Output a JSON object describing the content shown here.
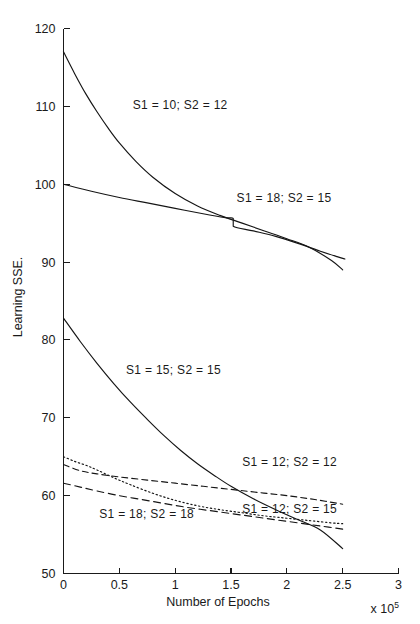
{
  "chart_data": {
    "type": "line",
    "title": "",
    "xlabel": "Number of Epochs",
    "ylabel": "Learning SSE.",
    "x_multiplier": "x 10",
    "x_multiplier_exponent": "5",
    "xlim": [
      0,
      3
    ],
    "ylim": [
      50,
      120
    ],
    "xticks": [
      "0",
      "0.5",
      "1",
      "1.5",
      "2",
      "2.5",
      "3"
    ],
    "xtick_values": [
      0,
      0.5,
      1,
      1.5,
      2,
      2.5,
      3
    ],
    "yticks": [
      "50",
      "60",
      "70",
      "80",
      "90",
      "100",
      "110",
      "120"
    ],
    "ytick_values": [
      50,
      60,
      70,
      80,
      90,
      100,
      110,
      120
    ],
    "grid": false,
    "legend_position": "inline-annotations",
    "series": [
      {
        "name": "S1 = 10;  S2 = 12",
        "style": "solid",
        "label_x": 0.62,
        "label_y": 110.2,
        "x": [
          0.0,
          0.1,
          0.2,
          0.3,
          0.4,
          0.5,
          0.65,
          0.8,
          1.0,
          1.2,
          1.4,
          1.6,
          1.8,
          2.0,
          2.2,
          2.4,
          2.5
        ],
        "y": [
          117.0,
          114.2,
          111.6,
          109.3,
          107.2,
          105.3,
          102.9,
          100.9,
          98.8,
          97.2,
          96.0,
          95.0,
          94.0,
          93.0,
          91.9,
          90.2,
          89.0
        ]
      },
      {
        "name": "S1 = 18;  S2 = 15",
        "style": "solid",
        "label_x": 1.55,
        "label_y": 98.2,
        "x": [
          0.0,
          0.25,
          0.5,
          0.75,
          1.0,
          1.25,
          1.45,
          1.52,
          1.52,
          1.7,
          1.9,
          2.1,
          2.3,
          2.45,
          2.52
        ],
        "y": [
          100.0,
          99.1,
          98.3,
          97.6,
          96.9,
          96.2,
          95.7,
          95.6,
          94.6,
          94.0,
          93.3,
          92.4,
          91.4,
          90.7,
          90.4
        ]
      },
      {
        "name": "S1 = 15;  S2 = 15",
        "style": "solid",
        "label_x": 0.56,
        "label_y": 76.2,
        "x": [
          0.0,
          0.15,
          0.3,
          0.45,
          0.6,
          0.75,
          0.9,
          1.05,
          1.2,
          1.35,
          1.5,
          1.7,
          1.9,
          2.1,
          2.3,
          2.5
        ],
        "y": [
          82.8,
          79.8,
          77.0,
          74.4,
          72.0,
          69.8,
          67.7,
          65.8,
          64.1,
          62.6,
          61.2,
          59.6,
          58.2,
          56.9,
          55.6,
          53.2
        ]
      },
      {
        "name": "S1 = 12;  S2 = 12",
        "style": "dashed",
        "label_x": 1.6,
        "label_y": 64.3,
        "x": [
          0.0,
          0.15,
          0.3,
          0.5,
          0.75,
          1.0,
          1.25,
          1.5,
          1.75,
          2.0,
          2.25,
          2.5
        ],
        "y": [
          64.0,
          63.2,
          62.8,
          62.4,
          62.0,
          61.6,
          61.2,
          60.8,
          60.4,
          60.0,
          59.5,
          58.9
        ]
      },
      {
        "name": "S1 = 12;  S2 = 15",
        "style": "dotted",
        "label_x": 1.6,
        "label_y": 58.3,
        "x": [
          0.0,
          0.1,
          0.2,
          0.3,
          0.45,
          0.6,
          0.8,
          1.0,
          1.2,
          1.4,
          1.6,
          1.8,
          2.0,
          2.2,
          2.4,
          2.5
        ],
        "y": [
          65.0,
          64.4,
          63.9,
          63.3,
          62.3,
          61.4,
          60.3,
          59.4,
          58.7,
          58.2,
          57.8,
          57.4,
          57.1,
          56.8,
          56.5,
          56.4
        ]
      },
      {
        "name": "S1 = 18;  S2 = 18",
        "style": "dashed2",
        "label_x": 0.32,
        "label_y": 57.6,
        "x": [
          0.0,
          0.15,
          0.3,
          0.5,
          0.7,
          0.9,
          1.1,
          1.3,
          1.5,
          1.7,
          1.9,
          2.1,
          2.3,
          2.5
        ],
        "y": [
          61.6,
          61.1,
          60.6,
          60.0,
          59.5,
          59.0,
          58.5,
          58.1,
          57.7,
          57.3,
          56.9,
          56.5,
          56.1,
          55.7
        ]
      }
    ]
  }
}
